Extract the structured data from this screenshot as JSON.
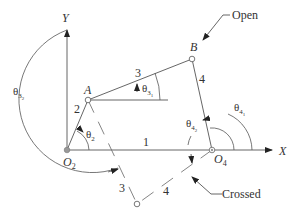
{
  "diagram": {
    "axes": {
      "x_label": "X",
      "y_label": "Y"
    },
    "points": {
      "A": "A",
      "B": "B",
      "O2": {
        "main": "O",
        "sub": "2"
      },
      "O4": {
        "main": "O",
        "sub": "4"
      }
    },
    "links": {
      "link1": "1",
      "link2": "2",
      "link3_open": "3",
      "link4_open": "4",
      "link3_crossed": "3",
      "link4_crossed": "4"
    },
    "angles": {
      "theta2": {
        "main": "θ",
        "sub": "2"
      },
      "theta3_1": {
        "main": "θ",
        "sub": "3",
        "subsub": "1"
      },
      "theta3_2": {
        "main": "θ",
        "sub": "3",
        "subsub": "2"
      },
      "theta4_1": {
        "main": "θ",
        "sub": "4",
        "subsub": "1"
      },
      "theta4_2": {
        "main": "θ",
        "sub": "4",
        "subsub": "2"
      }
    },
    "callouts": {
      "open": "Open",
      "crossed": "Crossed"
    },
    "colors": {
      "line": "#555555",
      "text": "#333333",
      "ground_pivot": "#999999"
    }
  }
}
